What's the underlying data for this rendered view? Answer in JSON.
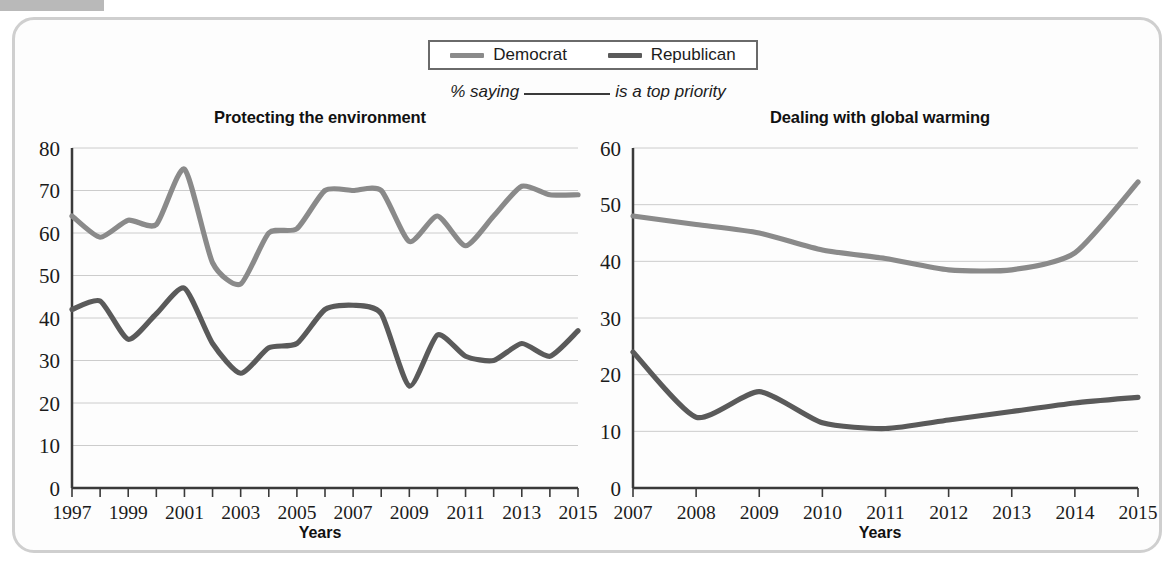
{
  "figure": {
    "legend": {
      "entries": [
        {
          "label": "Democrat",
          "color": "#8a8a8a",
          "swatch_name": "democrat-swatch"
        },
        {
          "label": "Republican",
          "color": "#5a5a5a",
          "swatch_name": "republican-swatch"
        }
      ]
    },
    "subtitle_prefix": "% saying",
    "subtitle_suffix": "is a top priority"
  },
  "chart_data": [
    {
      "type": "line",
      "title": "Protecting the environment",
      "xlabel": "Years",
      "ylabel": "",
      "ylim": [
        0,
        80
      ],
      "yticks": [
        0,
        10,
        20,
        30,
        40,
        50,
        60,
        70,
        80
      ],
      "xlim": [
        1997,
        2015
      ],
      "x": [
        1997,
        1998,
        1999,
        2000,
        2001,
        2002,
        2003,
        2004,
        2005,
        2006,
        2007,
        2008,
        2009,
        2010,
        2011,
        2012,
        2013,
        2014,
        2015
      ],
      "xticks": [
        1997,
        1998,
        1999,
        2000,
        2001,
        2002,
        2003,
        2004,
        2005,
        2006,
        2007,
        2008,
        2009,
        2010,
        2011,
        2012,
        2013,
        2014,
        2015
      ],
      "xticklabels": [
        "1997",
        "",
        "1999",
        "",
        "2001",
        "",
        "2003",
        "",
        "2005",
        "",
        "2007",
        "",
        "2009",
        "",
        "2011",
        "",
        "2013",
        "",
        "2015"
      ],
      "grid": true,
      "legend_position": "top-center-shared",
      "series": [
        {
          "name": "Democrat",
          "color": "#8a8a8a",
          "values": [
            64,
            59,
            63,
            62,
            75,
            53,
            48,
            60,
            61,
            70,
            70,
            70,
            58,
            64,
            57,
            64,
            71,
            69,
            69
          ]
        },
        {
          "name": "Republican",
          "color": "#5a5a5a",
          "values": [
            42,
            44,
            35,
            41,
            47,
            34,
            27,
            33,
            34,
            42,
            43,
            41,
            24,
            36,
            31,
            30,
            34,
            31,
            37
          ]
        }
      ]
    },
    {
      "type": "line",
      "title": "Dealing with global warming",
      "xlabel": "Years",
      "ylabel": "",
      "ylim": [
        0,
        60
      ],
      "yticks": [
        0,
        10,
        20,
        30,
        40,
        50,
        60
      ],
      "xlim": [
        2007,
        2015
      ],
      "x": [
        2007,
        2008,
        2009,
        2010,
        2011,
        2012,
        2013,
        2014,
        2015
      ],
      "xticks": [
        2007,
        2008,
        2009,
        2010,
        2011,
        2012,
        2013,
        2014,
        2015
      ],
      "xticklabels": [
        "2007",
        "2008",
        "2009",
        "2010",
        "2011",
        "2012",
        "2013",
        "2014",
        "2015"
      ],
      "grid": true,
      "legend_position": "top-center-shared",
      "series": [
        {
          "name": "Democrat",
          "color": "#8a8a8a",
          "values": [
            48,
            46.5,
            45,
            42,
            40.5,
            38.5,
            38.5,
            41.5,
            54
          ]
        },
        {
          "name": "Republican",
          "color": "#5a5a5a",
          "values": [
            24,
            12.5,
            17,
            11.5,
            10.5,
            12,
            13.5,
            15,
            16
          ]
        }
      ]
    }
  ]
}
